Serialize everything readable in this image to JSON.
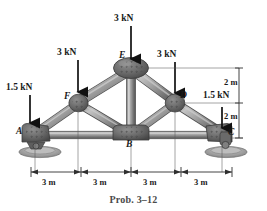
{
  "figure": {
    "caption": "Prob. 3–12",
    "type": "truss-free-body-diagram"
  },
  "colors": {
    "member_light": "#b9b9b9",
    "member_mid": "#8e8e8e",
    "member_dark": "#5d5d5d",
    "gusset": "#6b6b6b",
    "gusset_dark": "#4a4a4a",
    "ground": "#a8a8a8",
    "ink": "#1a1a1a",
    "caption": "#4a4a4a",
    "dim_line": "#3c3c3c"
  },
  "loads": [
    {
      "id": "load-A",
      "label": "1.5 kN",
      "magnitude": 1.5,
      "unit": "kN",
      "at_joint": "A",
      "direction": "down"
    },
    {
      "id": "load-F",
      "label": "3 kN",
      "magnitude": 3,
      "unit": "kN",
      "at_joint": "F",
      "direction": "down"
    },
    {
      "id": "load-E",
      "label": "3 kN",
      "magnitude": 3,
      "unit": "kN",
      "at_joint": "E",
      "direction": "down"
    },
    {
      "id": "load-D",
      "label": "3 kN",
      "magnitude": 3,
      "unit": "kN",
      "at_joint": "D",
      "direction": "down"
    },
    {
      "id": "load-C",
      "label": "1.5 kN",
      "magnitude": 1.5,
      "unit": "kN",
      "at_joint": "C",
      "direction": "down"
    }
  ],
  "joints": [
    {
      "id": "A",
      "label": "A",
      "x": 35,
      "y": 135,
      "support": "pin"
    },
    {
      "id": "B",
      "label": "B",
      "x": 130,
      "y": 135,
      "support": "none"
    },
    {
      "id": "C",
      "label": "C",
      "x": 222,
      "y": 135,
      "support": "roller"
    },
    {
      "id": "D",
      "label": "D",
      "x": 175,
      "y": 102,
      "support": "none"
    },
    {
      "id": "E",
      "label": "E",
      "x": 131,
      "y": 68,
      "support": "none"
    },
    {
      "id": "F",
      "label": "F",
      "x": 78,
      "y": 102,
      "support": "none"
    }
  ],
  "members": [
    {
      "from": "A",
      "to": "F"
    },
    {
      "from": "F",
      "to": "E"
    },
    {
      "from": "E",
      "to": "D"
    },
    {
      "from": "D",
      "to": "C"
    },
    {
      "from": "A",
      "to": "B"
    },
    {
      "from": "B",
      "to": "C"
    },
    {
      "from": "F",
      "to": "B"
    },
    {
      "from": "E",
      "to": "B"
    },
    {
      "from": "D",
      "to": "B"
    }
  ],
  "dimensions": {
    "horizontal": {
      "segments": [
        {
          "label": "3 m",
          "value": 3,
          "unit": "m"
        },
        {
          "label": "3 m",
          "value": 3,
          "unit": "m"
        },
        {
          "label": "3 m",
          "value": 3,
          "unit": "m"
        },
        {
          "label": "3 m",
          "value": 3,
          "unit": "m"
        }
      ],
      "total_label": "12 m"
    },
    "vertical": {
      "segments": [
        {
          "label": "2 m",
          "value": 2,
          "unit": "m"
        },
        {
          "label": "2 m",
          "value": 2,
          "unit": "m"
        }
      ],
      "total_label": "4 m"
    }
  }
}
